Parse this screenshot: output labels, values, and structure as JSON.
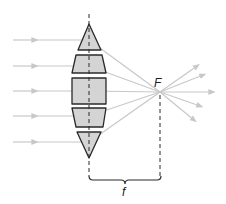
{
  "figure": {
    "focal_point_label": "F",
    "focal_length_label": "f"
  },
  "colors": {
    "ray": "#c8c8c8",
    "prism_fill": "#d4d4d4",
    "prism_stroke": "#2a2a2a",
    "axis_dash": "#2a2a2a",
    "text": "#1a1a1a"
  },
  "geometry": {
    "lens_axis_x": 89,
    "focal_point": [
      160,
      92
    ],
    "incoming_ray_y": [
      40,
      66,
      91,
      116,
      142
    ],
    "incoming_ray_start_x": 13,
    "outgoing_ray_tips": [
      [
        197,
        66
      ],
      [
        203,
        74
      ],
      [
        212,
        92
      ],
      [
        200,
        106
      ],
      [
        194,
        120
      ]
    ],
    "prisms": [
      {
        "type": "triangle",
        "points": "89,24 101,50 78,50"
      },
      {
        "type": "trapezoid",
        "points": "76,55 102,55 106,73 72,73"
      },
      {
        "type": "rectangle",
        "points": "72,78 106,78 106,104 72,104"
      },
      {
        "type": "trapezoid",
        "points": "72,108 106,108 103,127 76,127"
      },
      {
        "type": "triangle",
        "points": "77,132 101,132 89,158"
      }
    ],
    "brace": {
      "x1": 89,
      "x2": 161,
      "y": 180
    }
  }
}
